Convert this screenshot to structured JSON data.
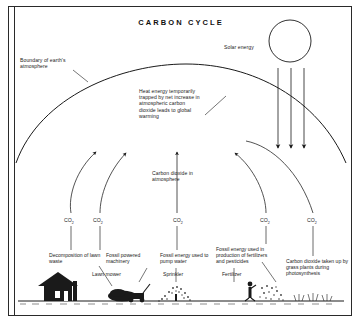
{
  "diagram": {
    "title": "CARBON CYCLE",
    "background_color": "#ffffff",
    "ink_color": "#1a1a1a"
  },
  "annotations": {
    "solar_energy": "Solar energy",
    "boundary": "Boundary of earth's atmosphere",
    "heat_trapped": "Heat energy temporarily trapped by net increase in atmospheric carbon dioxide leads to global warming",
    "atmosphere_pool": "Carbon dioxide in atmosphere"
  },
  "flux_labels": [
    {
      "id": "co2-1",
      "text": "CO",
      "sub": "2"
    },
    {
      "id": "co2-2",
      "text": "CO",
      "sub": "2"
    },
    {
      "id": "co2-3",
      "text": "CO",
      "sub": "2"
    },
    {
      "id": "co2-4",
      "text": "CO",
      "sub": "2"
    },
    {
      "id": "co2-5",
      "text": "CO",
      "sub": "2"
    }
  ],
  "sources": [
    {
      "id": "decomposition",
      "label": "Decomposition of lawn waste",
      "icon": "compost-pile-icon"
    },
    {
      "id": "fossil-machinery",
      "label": "Fossil powered machinery",
      "icon": "lawn-mower-icon",
      "sublabel": "Lawn mower"
    },
    {
      "id": "pump-water",
      "label": "Fossil energy used to pump water",
      "icon": "sprinkler-icon",
      "sublabel": "Sprinkler"
    },
    {
      "id": "fertilizer-production",
      "label": "Fossil energy used in production of fertilizers and pesticides",
      "icon": "fertilizer-spreader-icon",
      "sublabel": "Fertilizer"
    },
    {
      "id": "photosynthesis",
      "label": "Carbon dioxide taken up by grass plants during photosynthesis",
      "icon": "grass-icon"
    }
  ],
  "icons": {
    "sun": "sun-icon",
    "house": "house-icon",
    "solar_rays": "solar-ray-arrow-icon",
    "ground": "ground-line-icon"
  }
}
